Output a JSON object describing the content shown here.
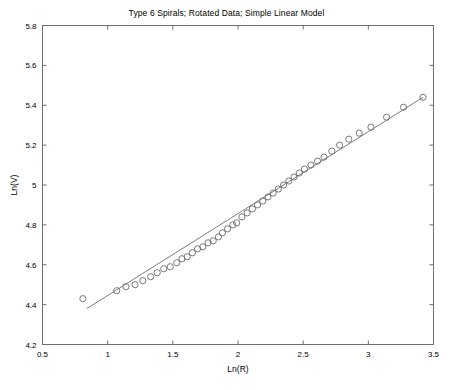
{
  "chart_data": {
    "type": "scatter",
    "title": "Type 6 Spirals; Rotated Data; Simple Linear Model",
    "xlabel": "Ln(R)",
    "ylabel": "Ln(V)",
    "xlim": [
      0.5,
      3.5
    ],
    "ylim": [
      4.2,
      5.8
    ],
    "xticks": [
      0.5,
      1,
      1.5,
      2,
      2.5,
      3,
      3.5
    ],
    "xticklabels": [
      "0.5",
      "1",
      "1.5",
      "2",
      "2.5",
      "3",
      "3.5"
    ],
    "yticks": [
      4.2,
      4.4,
      4.6,
      4.8,
      5.0,
      5.2,
      5.4,
      5.6,
      5.8
    ],
    "yticklabels": [
      "4.2",
      "4.4",
      "4.6",
      "4.8",
      "5",
      "5.2",
      "5.4",
      "5.6",
      "5.8"
    ],
    "grid": false,
    "legend": false,
    "marker": "open-circle",
    "marker_color": "#6b6b6b",
    "line_color": "#7d7d7d",
    "series": [
      {
        "name": "Rotated Data",
        "type": "scatter",
        "x": [
          0.81,
          1.07,
          1.14,
          1.21,
          1.27,
          1.33,
          1.38,
          1.43,
          1.48,
          1.53,
          1.57,
          1.61,
          1.65,
          1.69,
          1.73,
          1.77,
          1.81,
          1.85,
          1.88,
          1.92,
          1.96,
          1.99,
          2.03,
          2.07,
          2.11,
          2.15,
          2.19,
          2.23,
          2.27,
          2.31,
          2.35,
          2.39,
          2.43,
          2.47,
          2.51,
          2.56,
          2.61,
          2.66,
          2.72,
          2.78,
          2.85,
          2.93,
          3.02,
          3.14,
          3.27,
          3.42
        ],
        "y": [
          4.43,
          4.47,
          4.49,
          4.5,
          4.52,
          4.54,
          4.56,
          4.58,
          4.59,
          4.61,
          4.63,
          4.64,
          4.66,
          4.68,
          4.69,
          4.71,
          4.72,
          4.74,
          4.76,
          4.78,
          4.8,
          4.81,
          4.84,
          4.86,
          4.88,
          4.9,
          4.92,
          4.94,
          4.96,
          4.98,
          5.0,
          5.02,
          5.04,
          5.06,
          5.08,
          5.1,
          5.12,
          5.14,
          5.17,
          5.2,
          5.23,
          5.26,
          5.29,
          5.34,
          5.39,
          5.44
        ]
      },
      {
        "name": "Simple Linear Model",
        "type": "line",
        "x": [
          0.84,
          3.42
        ],
        "y": [
          4.38,
          5.44
        ]
      }
    ]
  },
  "axes": {
    "x_title": "Ln(R)",
    "y_title": "Ln(V)"
  }
}
